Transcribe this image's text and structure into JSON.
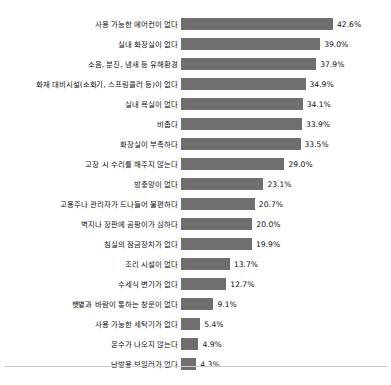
{
  "chart_data": {
    "type": "bar",
    "orientation": "horizontal",
    "title": "",
    "subtitle": "",
    "xlabel": "",
    "ylabel": "",
    "xlim": [
      0,
      42.6
    ],
    "grid": false,
    "legend": null,
    "value_suffix": "%",
    "bar_color": "#6f6f6f",
    "categories": [
      "사용 가능한 에어컨이 없다",
      "실내 화장실이 없다",
      "소음, 분진, 냄새 등 유해환경",
      "화재 대비시설(소화기, 스프링클러 등)이 없다",
      "실내 욕실이 없다",
      "비좁다",
      "화장실이 부족하다",
      "고장 시 수리를 해주지 않는다",
      "방충망이 없다",
      "고용주나 관리자가 드나들어 불편하다",
      "벽지나 장판에 곰팡이가 심하다",
      "침실의 잠금장치가 없다",
      "조리 시설이 없다",
      "수세식 변기가 없다",
      "햇볕과 바람이 통하는 창문이 없다",
      "사용 가능한 세탁기가 없다",
      "온수가 나오지 않는다",
      "난방용 보일러가 없다"
    ],
    "values": [
      42.6,
      39.0,
      37.9,
      34.9,
      34.1,
      33.9,
      33.5,
      29.0,
      23.1,
      20.7,
      20.0,
      19.9,
      13.7,
      12.7,
      9.1,
      5.4,
      4.9,
      4.3
    ],
    "value_labels": [
      "42.6%",
      "39.0%",
      "37.9%",
      "34.9%",
      "34.1%",
      "33.9%",
      "33.5%",
      "29.0%",
      "23.1%",
      "20.7%",
      "20.0%",
      "19.9%",
      "13.7%",
      "12.7%",
      "9.1%",
      "5.4%",
      "4.9%",
      "4.3%"
    ]
  },
  "footnote": {
    "text": ""
  }
}
